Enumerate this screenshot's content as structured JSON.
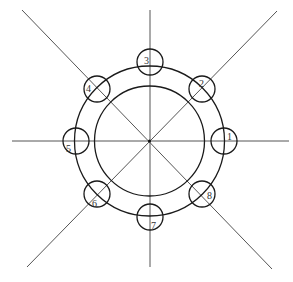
{
  "diagram": {
    "type": "bolt-circle",
    "center": {
      "x": 149.5,
      "y": 141
    },
    "colors": {
      "lines": "#555555",
      "circles": "#1a1a1a",
      "labels": "#333333",
      "background": "#ffffff"
    },
    "outer_circle": {
      "r": 75
    },
    "inner_circle": {
      "r": 55
    },
    "radial_lines": [
      {
        "x1": 12,
        "y1": 141,
        "x2": 289,
        "y2": 141
      },
      {
        "x1": 150,
        "y1": 10,
        "x2": 150,
        "y2": 267
      },
      {
        "x1": 22,
        "y1": 10,
        "x2": 272,
        "y2": 269
      },
      {
        "x1": 27,
        "y1": 267,
        "x2": 277,
        "y2": 11
      }
    ],
    "bolt_holes": [
      {
        "label": "1",
        "cx": 224,
        "cy": 141,
        "r": 13,
        "lx": 227,
        "ly": 140
      },
      {
        "label": "2",
        "cx": 202,
        "cy": 89,
        "r": 13,
        "lx": 199,
        "ly": 87
      },
      {
        "label": "3",
        "cx": 150,
        "cy": 62,
        "r": 13,
        "lx": 144,
        "ly": 64
      },
      {
        "label": "4",
        "cx": 97,
        "cy": 89,
        "r": 13,
        "lx": 86,
        "ly": 92
      },
      {
        "label": "5",
        "cx": 76,
        "cy": 141,
        "r": 13,
        "lx": 66,
        "ly": 152
      },
      {
        "label": "6",
        "cx": 97,
        "cy": 194,
        "r": 13,
        "lx": 92,
        "ly": 207
      },
      {
        "label": "7",
        "cx": 150,
        "cy": 217,
        "r": 13,
        "lx": 151,
        "ly": 229
      },
      {
        "label": "8",
        "cx": 202,
        "cy": 194,
        "r": 13,
        "lx": 207,
        "ly": 199
      }
    ]
  }
}
